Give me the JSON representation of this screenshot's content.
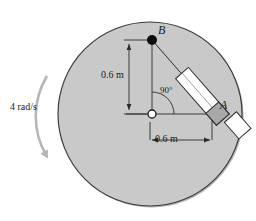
{
  "figure": {
    "type": "mechanism-diagram",
    "canvas": {
      "width": 256,
      "height": 221,
      "background": "#ffffff"
    },
    "disk": {
      "name": "gray-disk",
      "center_x": 150,
      "center_y": 114,
      "radius": 92,
      "fill_color": "#c9c9c9",
      "stroke_color": "#3a3a3a"
    },
    "points": {
      "center_pivot": {
        "label": "",
        "x": 152,
        "y": 114,
        "style": "open-circle"
      },
      "B": {
        "label": "B",
        "x": 152,
        "y": 40,
        "style": "filled-circle"
      },
      "A": {
        "label": "A",
        "x": 212,
        "y": 114,
        "style": "none"
      }
    },
    "rod": {
      "name": "slider-rod",
      "fill_color": "#ffffff",
      "collar_color": "#a8a8a8",
      "stroke_color": "#2b2b2b"
    },
    "dimensions": [
      {
        "id": "vertical",
        "label": "0.6 m",
        "orientation": "vertical"
      },
      {
        "id": "horizontal",
        "label": "0.6 m",
        "orientation": "horizontal"
      }
    ],
    "angle": {
      "label": "90°",
      "value": 90,
      "unit": "degrees"
    },
    "angular_velocity": {
      "label": "4 rad/s",
      "value": 4,
      "unit": "rad/s",
      "sense": "clockwise-arrow-left"
    }
  }
}
